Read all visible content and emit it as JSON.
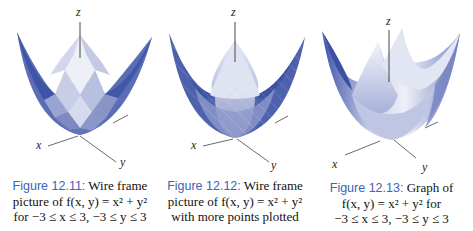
{
  "figures": [
    {
      "id": "12.11",
      "label": "Figure 12.11:",
      "caption_lines": [
        "Wire frame",
        "picture of f(x, y) = x² + y²",
        "for −3 ≤ x ≤ 3, −3 ≤ y ≤ 3"
      ],
      "caption_line1_rest": " Wire frame",
      "caption_line2": "picture of f(x, y) = x² + y²",
      "caption_line3": "for −3 ≤ x ≤ 3, −3 ≤ y ≤ 3",
      "style": "coarse wire frame",
      "axes": {
        "z": "z",
        "x": "x",
        "y": "y"
      }
    },
    {
      "id": "12.12",
      "label": "Figure 12.12:",
      "caption_line1_rest": " Wire frame",
      "caption_line2": "picture of f(x, y) = x² + y²",
      "caption_line3": "with more points plotted",
      "style": "fine wire frame",
      "axes": {
        "z": "z",
        "x": "x",
        "y": "y"
      }
    },
    {
      "id": "12.13",
      "label": "Figure 12.13:",
      "caption_line1_rest": " Graph of",
      "caption_line2": "f(x, y) = x² + y² for",
      "caption_line3": "−3 ≤ x ≤ 3, −3 ≤ y ≤ 3",
      "style": "smooth surface",
      "axes": {
        "z": "z",
        "x": "x",
        "y": "y"
      }
    }
  ],
  "colors": {
    "caption_label": "#3b63b8",
    "surface_dark": "#4a5fae",
    "surface_light": "#e6e9f4"
  }
}
